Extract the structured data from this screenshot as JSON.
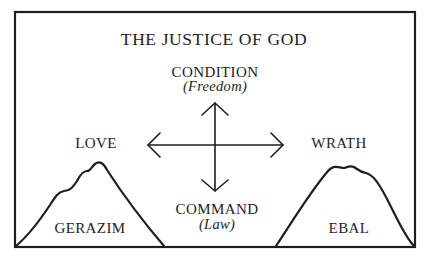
{
  "diagram": {
    "title": "THE JUSTICE OF GOD",
    "top": {
      "label": "CONDITION",
      "sublabel": "(Freedom)"
    },
    "bottom": {
      "label": "COMMAND",
      "sublabel": "(Law)"
    },
    "left": {
      "label": "LOVE"
    },
    "right": {
      "label": "WRATH"
    },
    "mountains": [
      {
        "name": "GERAZIM",
        "side": "left"
      },
      {
        "name": "EBAL",
        "side": "right"
      }
    ],
    "arrows": [
      "up",
      "down",
      "left",
      "right"
    ],
    "colors": {
      "stroke": "#1e1e1e",
      "background": "#ffffff"
    }
  }
}
